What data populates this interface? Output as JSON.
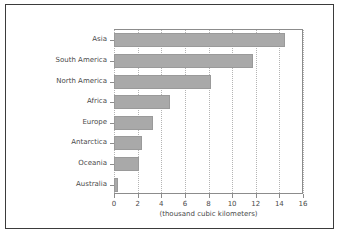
{
  "chart_data": {
    "type": "bar",
    "orientation": "horizontal",
    "title": "",
    "xlabel": "(thousand cubic kilometers)",
    "ylabel": "",
    "categories": [
      "Asia",
      "South America",
      "North America",
      "Africa",
      "Europe",
      "Antarctica",
      "Oceania",
      "Australia"
    ],
    "values": [
      14.5,
      11.8,
      8.2,
      4.7,
      3.3,
      2.4,
      2.1,
      0.35
    ],
    "xlim": [
      0,
      16
    ],
    "xticks": [
      0,
      2,
      4,
      6,
      8,
      10,
      12,
      14,
      16
    ],
    "xtick_labels": [
      "0",
      "2",
      "4",
      "6",
      "8",
      "10",
      "12",
      "14",
      "16"
    ],
    "grid": "vertical-dotted",
    "legend": null,
    "bar_color": "#a9a9a9",
    "bar_edge_color": "#9a9a9a",
    "axis_color": "#8c8c8c",
    "grid_color": "#b4b4b4",
    "text_color": "#4a4a4a",
    "frame_color": "#3b3b3b",
    "background": "#ffffff"
  }
}
